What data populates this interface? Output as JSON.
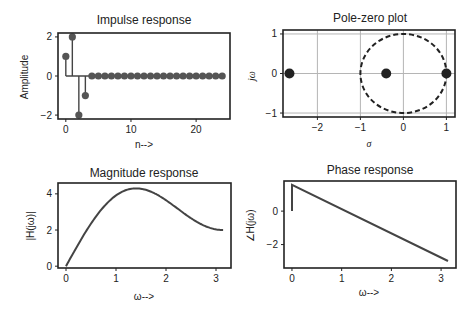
{
  "chart_data": [
    {
      "type": "stem",
      "title": "Impulse response",
      "xlabel": "n-->",
      "ylabel": "Amplitude",
      "x": [
        0,
        1,
        2,
        3,
        4,
        5,
        6,
        7,
        8,
        9,
        10,
        11,
        12,
        13,
        14,
        15,
        16,
        17,
        18,
        19,
        20,
        21,
        22,
        23,
        24
      ],
      "values": [
        1,
        2,
        -2,
        -1,
        0,
        0,
        0,
        0,
        0,
        0,
        0,
        0,
        0,
        0,
        0,
        0,
        0,
        0,
        0,
        0,
        0,
        0,
        0,
        0,
        0
      ],
      "xticks": [
        "0",
        "10",
        "20"
      ],
      "yticks": [
        "2",
        "0",
        "−2"
      ],
      "xlim": [
        -1.2,
        25.2
      ],
      "ylim": [
        -2.2,
        2.2
      ],
      "grid": false
    },
    {
      "type": "scatter",
      "title": "Pole-zero plot",
      "xlabel": "σ",
      "ylabel": "jω",
      "points": [
        {
          "x": -2.65,
          "y": 0
        },
        {
          "x": -0.4,
          "y": 0
        },
        {
          "x": 1.0,
          "y": 0
        }
      ],
      "unit_circle": {
        "center": [
          0,
          0
        ],
        "radius": 1,
        "style": "dashed"
      },
      "xticks": [
        "−2",
        "−1",
        "0",
        "1"
      ],
      "yticks": [
        "1",
        "0",
        "−1"
      ],
      "xlim": [
        -2.8,
        1.2
      ],
      "ylim": [
        -1.1,
        1.1
      ],
      "grid": true
    },
    {
      "type": "line",
      "title": "Magnitude response",
      "xlabel": "ω-->",
      "ylabel": "|H(jω)|",
      "x": [
        0,
        0.2,
        0.4,
        0.6,
        0.8,
        1.0,
        1.2,
        1.4,
        1.6,
        1.8,
        2.0,
        2.2,
        2.4,
        2.6,
        2.8,
        3.0,
        3.14
      ],
      "values": [
        0,
        0.77,
        1.6,
        2.42,
        3.15,
        3.76,
        4.18,
        4.36,
        4.28,
        3.98,
        3.53,
        3.04,
        2.6,
        2.28,
        2.1,
        2.02,
        2.0
      ],
      "xticks": [
        "0",
        "1",
        "2",
        "3"
      ],
      "yticks": [
        "4",
        "2",
        "0"
      ],
      "xlim": [
        -0.16,
        3.3
      ],
      "ylim": [
        -0.1,
        4.6
      ],
      "grid": false
    },
    {
      "type": "line",
      "title": "Phase response",
      "xlabel": "ω-->",
      "ylabel": "∠H(jω)",
      "x": [
        0,
        0.001,
        3.14
      ],
      "values": [
        0,
        1.57,
        -2.98
      ],
      "xticks": [
        "0",
        "1",
        "2",
        "3"
      ],
      "yticks": [
        "0",
        "−2"
      ],
      "xlim": [
        -0.16,
        3.3
      ],
      "ylim": [
        -3.4,
        1.8
      ],
      "grid": false
    }
  ],
  "labels": {
    "impulse": {
      "title": "Impulse response",
      "xlabel": "n-->",
      "ylabel": "Amplitude"
    },
    "polezero": {
      "title": "Pole-zero plot",
      "xlabel": "σ",
      "ylabel": "jω"
    },
    "magnitude": {
      "title": "Magnitude response",
      "xlabel": "ω-->",
      "ylabel": "|H(jω)|"
    },
    "phase": {
      "title": "Phase response",
      "xlabel": "ω-->",
      "ylabel": "∠H(jω)"
    }
  },
  "colors": {
    "line": "#444444",
    "frame": "#222222",
    "grid": "#b5b5b5",
    "marker": "#333333"
  }
}
